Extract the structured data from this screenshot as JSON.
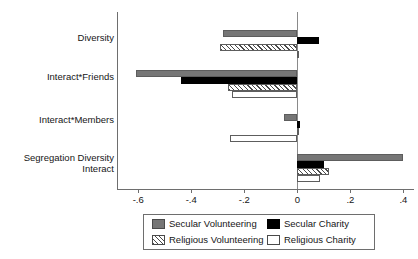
{
  "chart_data": {
    "type": "bar",
    "orientation": "horizontal",
    "title": "",
    "xlabel": "",
    "ylabel": "",
    "xlim": [
      -0.68,
      0.44
    ],
    "grid": false,
    "zero_line": true,
    "legend_position": "bottom",
    "xticks": [
      -0.6,
      -0.4,
      -0.2,
      0,
      0.2,
      0.4
    ],
    "xticklabels": [
      "-.6",
      "-.4",
      "-.2",
      "0",
      ".2",
      ".4"
    ],
    "categories": [
      "Diversity",
      "Interact*Friends",
      "Interact*Members",
      "Segregation Diversity\nInteract"
    ],
    "series": [
      {
        "name": "Secular Volunteering",
        "style": "solid-gray",
        "color": "#767676",
        "values": [
          -0.28,
          -0.61,
          -0.05,
          0.4
        ]
      },
      {
        "name": "Secular Charity",
        "style": "solid-black",
        "color": "#000000",
        "values": [
          0.08,
          -0.44,
          0.01,
          0.1
        ]
      },
      {
        "name": "Religious Volunteering",
        "style": "hatched",
        "color": "#4a4a4a",
        "values": [
          -0.29,
          -0.26,
          0.0,
          0.12
        ]
      },
      {
        "name": "Religious Charity",
        "style": "white-outline",
        "color": "#ffffff",
        "values": [
          0.005,
          -0.245,
          -0.255,
          0.085
        ]
      }
    ]
  },
  "legend": {
    "entries": [
      {
        "label": "Secular Volunteering",
        "swatch": "secvol"
      },
      {
        "label": "Secular Charity",
        "swatch": "secchar"
      },
      {
        "label": "Religious Volunteering",
        "swatch": "relvol"
      },
      {
        "label": "Religious Charity",
        "swatch": "relchar"
      }
    ]
  }
}
